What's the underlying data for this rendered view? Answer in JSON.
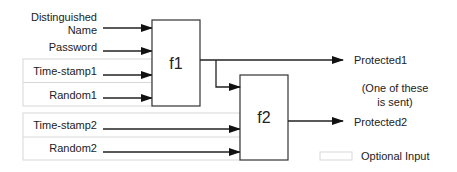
{
  "diagram": {
    "inputs": {
      "distinguished_name_line1": "Distinguished",
      "distinguished_name_line2": "Name",
      "password": "Password",
      "time_stamp1": "Time-stamp1",
      "random1": "Random1",
      "time_stamp2": "Time-stamp2",
      "random2": "Random2"
    },
    "functions": {
      "f1": "f1",
      "f2": "f2"
    },
    "outputs": {
      "protected1": "Protected1",
      "protected2": "Protected2"
    },
    "note": {
      "line1": "(One of these",
      "line2": "is sent)"
    },
    "legend": {
      "optional_input": "Optional Input"
    },
    "colors": {
      "line": "#222222",
      "optional_border": "#d8d8d8",
      "text": "#222222"
    }
  }
}
